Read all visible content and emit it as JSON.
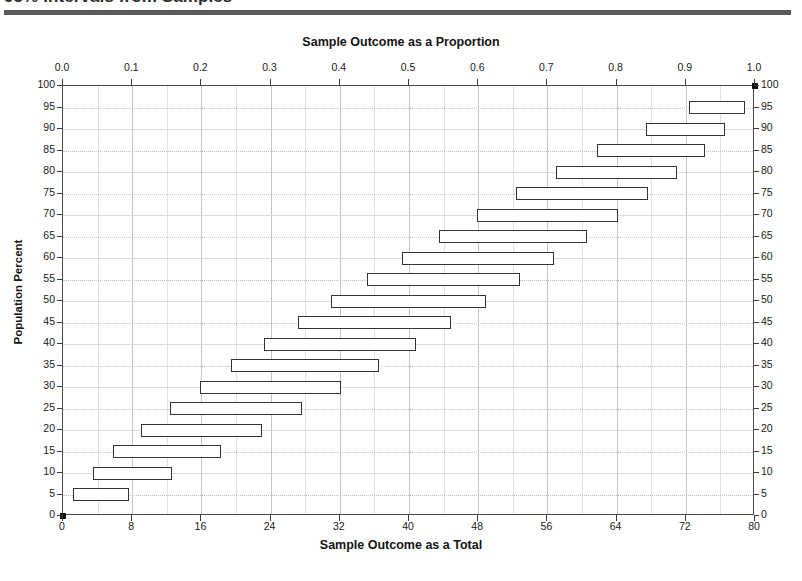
{
  "header": {
    "title": "95% Intervals from Samples",
    "rule_color": "#5a5a5a"
  },
  "chart_data": {
    "type": "interval",
    "title_top": "Sample Outcome as a Proportion",
    "title_bottom": "Sample Outcome as a Total",
    "ylabel": "Population Percent",
    "xlabel": "Sample Outcome as a Total",
    "grid": true,
    "legend": "none",
    "sample_size": 80,
    "confidence_level": "95%",
    "top_axis": {
      "label": "Sample Outcome as a Proportion",
      "ticks": [
        "0.0",
        "0.1",
        "0.2",
        "0.3",
        "0.4",
        "0.5",
        "0.6",
        "0.7",
        "0.8",
        "0.9",
        "1.0"
      ],
      "values": [
        0.0,
        0.1,
        0.2,
        0.3,
        0.4,
        0.5,
        0.6,
        0.7,
        0.8,
        0.9,
        1.0
      ],
      "range": [
        0.0,
        1.0
      ]
    },
    "bottom_axis": {
      "label": "Sample Outcome as a Total",
      "ticks": [
        "0",
        "8",
        "16",
        "24",
        "32",
        "40",
        "48",
        "56",
        "64",
        "72",
        "80"
      ],
      "values": [
        0,
        8,
        16,
        24,
        32,
        40,
        48,
        56,
        64,
        72,
        80
      ],
      "range": [
        0,
        80
      ]
    },
    "y_axis": {
      "label": "Population Percent",
      "ticks": [
        "0",
        "5",
        "10",
        "15",
        "20",
        "25",
        "30",
        "35",
        "40",
        "45",
        "50",
        "55",
        "60",
        "65",
        "70",
        "75",
        "80",
        "85",
        "90",
        "95",
        "100"
      ],
      "values": [
        0,
        5,
        10,
        15,
        20,
        25,
        30,
        35,
        40,
        45,
        50,
        55,
        60,
        65,
        70,
        75,
        80,
        85,
        90,
        95,
        100
      ],
      "range": [
        0,
        100
      ],
      "mirrored_right": true
    },
    "categories": [
      0,
      5,
      10,
      15,
      20,
      25,
      30,
      35,
      40,
      45,
      50,
      55,
      60,
      65,
      70,
      75,
      80,
      85,
      90,
      95,
      100
    ],
    "intervals": [
      {
        "population_percent": 0,
        "low": 0.0,
        "high": 0.0,
        "low_total": 0.0,
        "high_total": 0.0,
        "drawn": false
      },
      {
        "population_percent": 5,
        "low": 0.015,
        "high": 0.095,
        "low_total": 1.2,
        "high_total": 7.6,
        "drawn": true
      },
      {
        "population_percent": 10,
        "low": 0.043,
        "high": 0.157,
        "low_total": 3.4,
        "high_total": 12.6,
        "drawn": true
      },
      {
        "population_percent": 15,
        "low": 0.072,
        "high": 0.228,
        "low_total": 5.8,
        "high_total": 18.2,
        "drawn": true
      },
      {
        "population_percent": 20,
        "low": 0.112,
        "high": 0.288,
        "low_total": 9.0,
        "high_total": 23.0,
        "drawn": true
      },
      {
        "population_percent": 25,
        "low": 0.155,
        "high": 0.345,
        "low_total": 12.4,
        "high_total": 27.6,
        "drawn": true
      },
      {
        "population_percent": 30,
        "low": 0.198,
        "high": 0.402,
        "low_total": 15.8,
        "high_total": 32.2,
        "drawn": true
      },
      {
        "population_percent": 35,
        "low": 0.243,
        "high": 0.457,
        "low_total": 19.4,
        "high_total": 36.6,
        "drawn": true
      },
      {
        "population_percent": 40,
        "low": 0.29,
        "high": 0.51,
        "low_total": 23.2,
        "high_total": 40.8,
        "drawn": true
      },
      {
        "population_percent": 45,
        "low": 0.339,
        "high": 0.561,
        "low_total": 27.1,
        "high_total": 44.9,
        "drawn": true
      },
      {
        "population_percent": 50,
        "low": 0.388,
        "high": 0.612,
        "low_total": 31.0,
        "high_total": 49.0,
        "drawn": true
      },
      {
        "population_percent": 55,
        "low": 0.439,
        "high": 0.661,
        "low_total": 35.1,
        "high_total": 52.9,
        "drawn": true
      },
      {
        "population_percent": 60,
        "low": 0.49,
        "high": 0.71,
        "low_total": 39.2,
        "high_total": 56.8,
        "drawn": true
      },
      {
        "population_percent": 65,
        "low": 0.543,
        "high": 0.757,
        "low_total": 43.4,
        "high_total": 60.6,
        "drawn": true
      },
      {
        "population_percent": 70,
        "low": 0.598,
        "high": 0.802,
        "low_total": 47.8,
        "high_total": 64.2,
        "drawn": true
      },
      {
        "population_percent": 75,
        "low": 0.655,
        "high": 0.845,
        "low_total": 52.4,
        "high_total": 67.6,
        "drawn": true
      },
      {
        "population_percent": 80,
        "low": 0.712,
        "high": 0.888,
        "low_total": 57.0,
        "high_total": 71.0,
        "drawn": true
      },
      {
        "population_percent": 85,
        "low": 0.772,
        "high": 0.928,
        "low_total": 61.8,
        "high_total": 74.2,
        "drawn": true
      },
      {
        "population_percent": 90,
        "low": 0.843,
        "high": 0.957,
        "low_total": 67.4,
        "high_total": 76.6,
        "drawn": true
      },
      {
        "population_percent": 95,
        "low": 0.905,
        "high": 0.985,
        "low_total": 72.4,
        "high_total": 78.8,
        "drawn": true
      },
      {
        "population_percent": 100,
        "low": 1.0,
        "high": 1.0,
        "low_total": 80.0,
        "high_total": 80.0,
        "drawn": false
      }
    ]
  }
}
